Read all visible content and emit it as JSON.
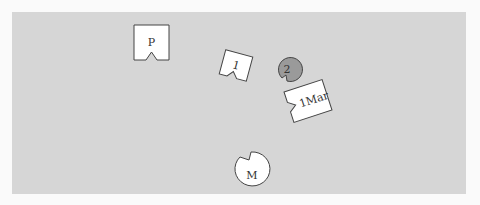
{
  "board": {
    "background": "#d6d6d6",
    "page_background": "#fafafa"
  },
  "pieces": [
    {
      "id": "P",
      "label": "P",
      "shape": "square-notch",
      "fill": "#ffffff"
    },
    {
      "id": "1",
      "label": "1",
      "shape": "square-notch-rotated",
      "fill": "#ffffff"
    },
    {
      "id": "2",
      "label": "2",
      "shape": "circle-notch",
      "fill": "#9a9a9a"
    },
    {
      "id": "1Mar",
      "label": "1Mar",
      "shape": "square-notch-rotated",
      "fill": "#ffffff"
    },
    {
      "id": "M",
      "label": "M",
      "shape": "circle-notch",
      "fill": "#ffffff"
    }
  ]
}
